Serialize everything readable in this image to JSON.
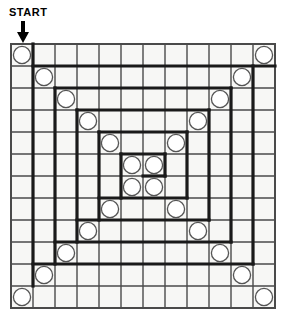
{
  "puzzle": {
    "start_label": "START",
    "arrow_icon": "down-arrow-icon",
    "grid": {
      "rows": 12,
      "cols": 12,
      "cell_size": 22,
      "origin_x": 11,
      "origin_y": 44,
      "line_color": "#4a4a4a",
      "thick_line_color": "#1a1a1a",
      "border_color": "#4a4a4a",
      "cell_fill": "#f7f7f5",
      "thin_width": 1.4,
      "thick_width": 3.2
    },
    "circle": {
      "radius": 8.6,
      "stroke": "#555555",
      "fill": "#ffffff",
      "stroke_width": 1.3
    },
    "circles": [
      {
        "row": 0,
        "col": 0
      },
      {
        "row": 1,
        "col": 1
      },
      {
        "row": 2,
        "col": 2
      },
      {
        "row": 3,
        "col": 3
      },
      {
        "row": 4,
        "col": 4
      },
      {
        "row": 5,
        "col": 5
      },
      {
        "row": 6,
        "col": 6
      },
      {
        "row": 7,
        "col": 7
      },
      {
        "row": 8,
        "col": 8
      },
      {
        "row": 9,
        "col": 9
      },
      {
        "row": 10,
        "col": 10
      },
      {
        "row": 11,
        "col": 11
      },
      {
        "row": 0,
        "col": 11
      },
      {
        "row": 1,
        "col": 10
      },
      {
        "row": 2,
        "col": 9
      },
      {
        "row": 3,
        "col": 8
      },
      {
        "row": 4,
        "col": 7
      },
      {
        "row": 5,
        "col": 6
      },
      {
        "row": 6,
        "col": 5
      },
      {
        "row": 7,
        "col": 4
      },
      {
        "row": 8,
        "col": 3
      },
      {
        "row": 9,
        "col": 2
      },
      {
        "row": 10,
        "col": 1
      },
      {
        "row": 11,
        "col": 0
      }
    ],
    "spiral_segments": [
      {
        "type": "v",
        "col": 1,
        "row_start": 0,
        "row_end": 11
      },
      {
        "type": "h",
        "row": 1,
        "col_start": 1,
        "col_end": 12
      },
      {
        "type": "v",
        "col": 11,
        "row_start": 1,
        "row_end": 10
      },
      {
        "type": "h",
        "row": 10,
        "col_start": 1,
        "col_end": 11
      },
      {
        "type": "v",
        "col": 2,
        "row_start": 2,
        "row_end": 10
      },
      {
        "type": "h",
        "row": 2,
        "col_start": 2,
        "col_end": 10
      },
      {
        "type": "v",
        "col": 10,
        "row_start": 2,
        "row_end": 9
      },
      {
        "type": "h",
        "row": 9,
        "col_start": 2,
        "col_end": 10
      },
      {
        "type": "v",
        "col": 3,
        "row_start": 3,
        "row_end": 9
      },
      {
        "type": "h",
        "row": 3,
        "col_start": 3,
        "col_end": 9
      },
      {
        "type": "v",
        "col": 9,
        "row_start": 3,
        "row_end": 8
      },
      {
        "type": "h",
        "row": 8,
        "col_start": 3,
        "col_end": 9
      },
      {
        "type": "v",
        "col": 4,
        "row_start": 4,
        "row_end": 8
      },
      {
        "type": "h",
        "row": 4,
        "col_start": 4,
        "col_end": 8
      },
      {
        "type": "v",
        "col": 8,
        "row_start": 4,
        "row_end": 7
      },
      {
        "type": "h",
        "row": 7,
        "col_start": 4,
        "col_end": 8
      },
      {
        "type": "v",
        "col": 5,
        "row_start": 5,
        "row_end": 7
      },
      {
        "type": "h",
        "row": 5,
        "col_start": 5,
        "col_end": 7
      },
      {
        "type": "v",
        "col": 7,
        "row_start": 5,
        "row_end": 6
      },
      {
        "type": "h",
        "row": 6,
        "col_start": 6,
        "col_end": 7
      }
    ]
  }
}
